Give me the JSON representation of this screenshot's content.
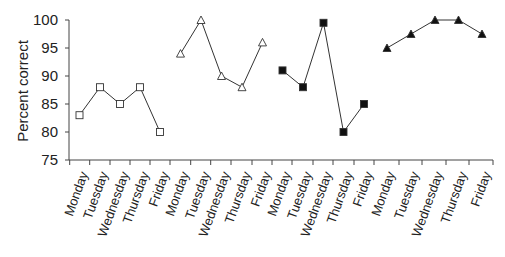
{
  "chart_data": {
    "type": "line",
    "title": "",
    "xlabel": "",
    "ylabel": "Percent correct",
    "ylim": [
      75,
      100
    ],
    "yticks": [
      75,
      80,
      85,
      90,
      95,
      100
    ],
    "grid": false,
    "legend": null,
    "categories": [
      "Monday",
      "Tuesday",
      "Wednesday",
      "Thursday",
      "Friday",
      "Monday",
      "Tuesday",
      "Wednesday",
      "Thursday",
      "Friday",
      "Monday",
      "Tuesday",
      "Wednesday",
      "Thursday",
      "Friday",
      "Monday",
      "Tuesday",
      "Wednesday",
      "Thursday",
      "Friday"
    ],
    "series": [
      {
        "name": "Group 1",
        "marker": "open-square",
        "x": [
          "Monday",
          "Tuesday",
          "Wednesday",
          "Thursday",
          "Friday"
        ],
        "values": [
          83,
          88,
          85,
          88,
          80
        ]
      },
      {
        "name": "Group 2",
        "marker": "open-triangle",
        "x": [
          "Monday",
          "Tuesday",
          "Wednesday",
          "Thursday",
          "Friday"
        ],
        "values": [
          94,
          100,
          90,
          88,
          96
        ]
      },
      {
        "name": "Group 3",
        "marker": "filled-square",
        "x": [
          "Monday",
          "Tuesday",
          "Wednesday",
          "Thursday",
          "Friday"
        ],
        "values": [
          91,
          88,
          99.5,
          80,
          85
        ]
      },
      {
        "name": "Group 4",
        "marker": "filled-triangle",
        "x": [
          "Monday",
          "Tuesday",
          "Wednesday",
          "Thursday",
          "Friday"
        ],
        "values": [
          95,
          97.5,
          100,
          100,
          97.5
        ]
      }
    ]
  },
  "axis": {
    "ylabel": "Percent correct",
    "yticks": [
      "100",
      "95",
      "90",
      "85",
      "80",
      "75"
    ],
    "xticks": [
      "Monday",
      "Tuesday",
      "Wednesday",
      "Thursday",
      "Friday",
      "Monday",
      "Tuesday",
      "Wednesday",
      "Thursday",
      "Friday",
      "Monday",
      "Tuesday",
      "Wednesday",
      "Thursday",
      "Friday",
      "Monday",
      "Tuesday",
      "Wednesday",
      "Thursday",
      "Friday"
    ]
  },
  "colors": {
    "line": "#333333",
    "axis": "#444444",
    "marker_fill": "#111111"
  }
}
